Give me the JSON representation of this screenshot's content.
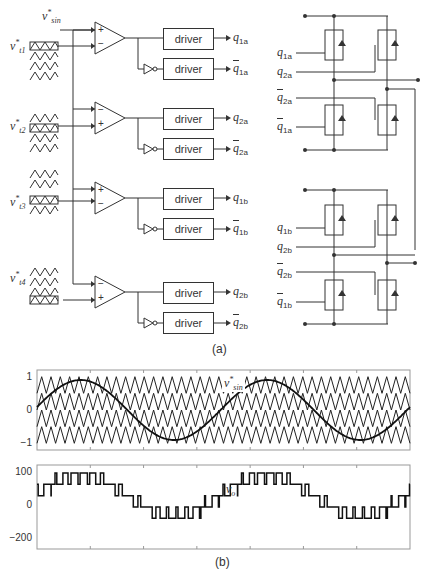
{
  "figure_a": {
    "caption": "(a)",
    "ref_label": {
      "base": "v",
      "sup": "*",
      "sub": "sin"
    },
    "carriers": [
      {
        "base": "v",
        "sup": "*",
        "sub": "t1"
      },
      {
        "base": "v",
        "sup": "*",
        "sub": "t2"
      },
      {
        "base": "v",
        "sup": "*",
        "sub": "t3"
      },
      {
        "base": "v",
        "sup": "*",
        "sub": "t4"
      }
    ],
    "comparators": [
      {
        "top": "+",
        "bottom": "−"
      },
      {
        "top": "−",
        "bottom": "+"
      },
      {
        "top": "+",
        "bottom": "−"
      },
      {
        "top": "−",
        "bottom": "+"
      }
    ],
    "driver_label": "driver",
    "outputs": [
      {
        "q": "q",
        "sub": "1a",
        "bar": false
      },
      {
        "q": "q",
        "sub": "1a",
        "bar": true
      },
      {
        "q": "q",
        "sub": "2a",
        "bar": false
      },
      {
        "q": "q",
        "sub": "2a",
        "bar": true
      },
      {
        "q": "q",
        "sub": "1b",
        "bar": false
      },
      {
        "q": "q",
        "sub": "1b",
        "bar": true
      },
      {
        "q": "q",
        "sub": "2b",
        "bar": false
      },
      {
        "q": "q",
        "sub": "2b",
        "bar": true
      }
    ],
    "bridge_gate_labels_a": [
      {
        "q": "q",
        "sub": "1a",
        "bar": false
      },
      {
        "q": "q",
        "sub": "2a",
        "bar": false
      },
      {
        "q": "q",
        "sub": "2a",
        "bar": true
      },
      {
        "q": "q",
        "sub": "1a",
        "bar": true
      }
    ],
    "bridge_gate_labels_b": [
      {
        "q": "q",
        "sub": "1b",
        "bar": false
      },
      {
        "q": "q",
        "sub": "2b",
        "bar": false
      },
      {
        "q": "q",
        "sub": "2b",
        "bar": true
      },
      {
        "q": "q",
        "sub": "1b",
        "bar": true
      }
    ]
  },
  "figure_b": {
    "caption": "(b)"
  },
  "chart_data": [
    {
      "type": "line",
      "title": "",
      "annotation": "v*sin",
      "xlabel": "",
      "ylabel": "",
      "ylim": [
        -1.2,
        1.2
      ],
      "yticks": [
        "1",
        "0",
        "−1"
      ],
      "grid": false,
      "series": [
        {
          "name": "v*sin",
          "description": "sinusoidal reference, amplitude ~0.9, ~2 cycles",
          "amplitude": 0.9,
          "cycles": 2.0
        },
        {
          "name": "v*t1",
          "description": "triangular carrier",
          "range": [
            0.5,
            1.0
          ]
        },
        {
          "name": "v*t2",
          "description": "triangular carrier",
          "range": [
            0.0,
            0.5
          ]
        },
        {
          "name": "v*t3",
          "description": "triangular carrier",
          "range": [
            -0.5,
            0.0
          ]
        },
        {
          "name": "v*t4",
          "description": "triangular carrier",
          "range": [
            -1.0,
            -0.5
          ]
        }
      ],
      "carrier_periods": 40
    },
    {
      "type": "line",
      "title": "",
      "annotation": "vo",
      "xlabel": "",
      "ylabel": "",
      "ylim": [
        -220,
        120
      ],
      "yticks": [
        "100",
        "0",
        "−200"
      ],
      "grid": false,
      "series": [
        {
          "name": "vo",
          "description": "five-level stepped PWM output voltage",
          "levels": [
            -200,
            -150,
            -100,
            -50,
            0,
            50,
            100
          ]
        }
      ]
    }
  ]
}
